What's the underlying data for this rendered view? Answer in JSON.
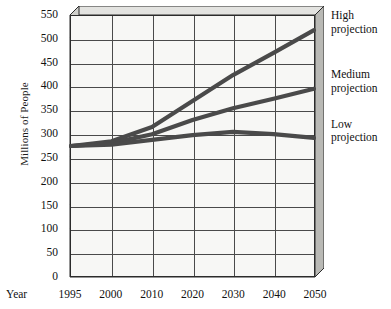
{
  "chart_data": {
    "type": "line",
    "title": "",
    "xlabel": "Year",
    "ylabel": "Millions of People",
    "x": [
      "1995",
      "2000",
      "2010",
      "2020",
      "2030",
      "2040",
      "2050"
    ],
    "ylim": [
      0,
      550
    ],
    "ytick_step": 50,
    "yticks": [
      "550",
      "500",
      "450",
      "400",
      "350",
      "300",
      "250",
      "200",
      "150",
      "100",
      "50",
      "0"
    ],
    "grid": true,
    "legend_position": "right",
    "series": [
      {
        "name": "High projection",
        "values": [
          275,
          285,
          315,
          370,
          425,
          472,
          520
        ],
        "color": "#4a4a4a"
      },
      {
        "name": "Medium projection",
        "values": [
          275,
          281,
          300,
          330,
          355,
          375,
          396
        ],
        "color": "#4a4a4a"
      },
      {
        "name": "Low projection",
        "values": [
          275,
          278,
          288,
          298,
          305,
          300,
          292
        ],
        "color": "#4a4a4a"
      }
    ]
  },
  "axes": {
    "y_title": "Millions of People",
    "x_title": "Year"
  },
  "legend": [
    {
      "line1": "High",
      "line2": "projection"
    },
    {
      "line1": "Medium",
      "line2": "projection"
    },
    {
      "line1": "Low",
      "line2": "projection"
    }
  ],
  "style": {
    "line_color": "#4a4a4a",
    "grid_color": "#4a4a4a",
    "plot_bg": "#f7f7f5",
    "box_face_color": "#d9d9d6",
    "axis_color": "#2b2b2b",
    "text_color": "#111111"
  }
}
